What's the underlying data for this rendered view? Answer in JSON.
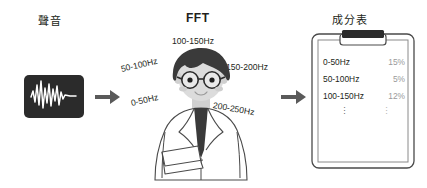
{
  "diagram": {
    "headings": {
      "sound": "聲音",
      "fft": "FFT",
      "table": "成分表"
    },
    "icons": {
      "waveform": "audio-waveform-icon",
      "arrow_1": "right-arrow-icon",
      "arrow_2": "right-arrow-icon",
      "scientist": "scientist-with-glasses-illustration",
      "clipboard": "clipboard-icon"
    },
    "frequency_labels": [
      {
        "text": "100-150Hz"
      },
      {
        "text": "50-100Hz"
      },
      {
        "text": "0-50Hz"
      },
      {
        "text": "150-200Hz"
      },
      {
        "text": "200-250Hz"
      }
    ],
    "composition_table": {
      "rows": [
        {
          "band": "0-50Hz",
          "percent": "15%"
        },
        {
          "band": "50-100Hz",
          "percent": "5%"
        },
        {
          "band": "100-150Hz",
          "percent": "12%"
        }
      ],
      "continuation": "⋮"
    },
    "colors": {
      "ink": "#231f20",
      "waveform_card": "#2b2b2b",
      "waveform_stroke": "#ffffff",
      "arrow": "#5a5a5a",
      "value_text": "#9a9a9a",
      "hair": "#3a3a3a",
      "skin": "#d9d9d9",
      "coat": "#ffffff",
      "outline": "#4a4a4a",
      "background": "#ffffff"
    }
  }
}
